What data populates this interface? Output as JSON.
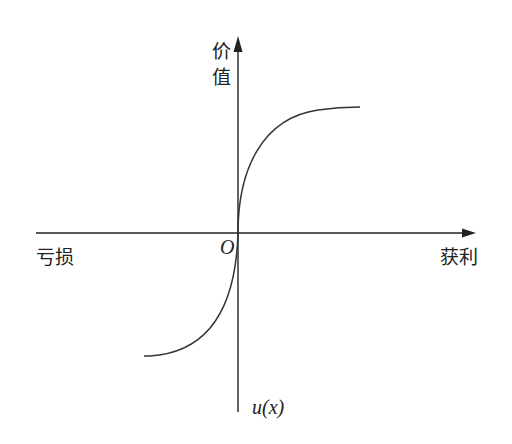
{
  "diagram": {
    "type": "value-function",
    "y_axis_label_line1": "价",
    "y_axis_label_line2": "值",
    "x_axis_left_label": "亏损",
    "x_axis_right_label": "获利",
    "origin_label": "O",
    "curve_label": "u(x)",
    "colors": {
      "line": "#222222",
      "background": "#ffffff"
    }
  }
}
